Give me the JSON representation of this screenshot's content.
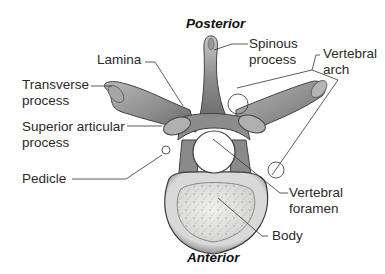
{
  "diagram": {
    "orientation": {
      "top": "Posterior",
      "bottom": "Anterior"
    },
    "labels": {
      "lamina": "Lamina",
      "spinous_process_1": "Spinous",
      "spinous_process_2": "process",
      "vertebral_arch_1": "Vertebral",
      "vertebral_arch_2": "arch",
      "transverse_process_1": "Transverse",
      "transverse_process_2": "process",
      "superior_articular_1": "Superior articular",
      "superior_articular_2": "process",
      "pedicle": "Pedicle",
      "vertebral_foramen_1": "Vertebral",
      "vertebral_foramen_2": "foramen",
      "body": "Body"
    },
    "colors": {
      "bone_dark": "#555555",
      "bone_mid": "#9a9a9a",
      "bone_light": "#d6d6d6",
      "body_spongy": "#e4e4e0",
      "leader_line": "#333333",
      "text": "#2a2a2a"
    }
  }
}
